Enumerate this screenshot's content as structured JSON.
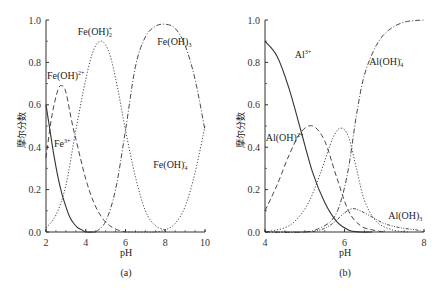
{
  "chart_data": [
    {
      "type": "line",
      "panel": "(a)",
      "xlabel": "pH",
      "ylabel": "摩尔分数",
      "xlim": [
        2,
        10
      ],
      "ylim": [
        0,
        1.0
      ],
      "xticks": [
        "2",
        "4",
        "6",
        "8",
        "10"
      ],
      "yticks": [
        "0.0",
        "0.2",
        "0.4",
        "0.6",
        "0.8",
        "1.0"
      ],
      "series": [
        {
          "name": "Fe3+",
          "label": "Fe",
          "sup": "3+",
          "sub": "",
          "style": "solid",
          "x": [
            2.0,
            2.2,
            2.4,
            2.6,
            2.8,
            3.0,
            3.2,
            3.4,
            3.6,
            3.8,
            4.0,
            4.5
          ],
          "y": [
            0.6,
            0.48,
            0.36,
            0.26,
            0.18,
            0.12,
            0.07,
            0.04,
            0.02,
            0.01,
            0.0,
            0.0
          ]
        },
        {
          "name": "Fe(OH)2+",
          "label": "Fe(OH)",
          "sup": "2+",
          "sub": "",
          "style": "dashed",
          "x": [
            2.0,
            2.3,
            2.6,
            2.8,
            3.0,
            3.3,
            3.6,
            4.0,
            4.4,
            4.8,
            5.2,
            5.6,
            6.0
          ],
          "y": [
            0.35,
            0.55,
            0.67,
            0.69,
            0.66,
            0.52,
            0.4,
            0.25,
            0.14,
            0.07,
            0.03,
            0.01,
            0.0
          ]
        },
        {
          "name": "Fe(OH)2+",
          "label": "Fe(OH)",
          "sup": "+",
          "sub": "2",
          "style": "dotted",
          "x": [
            2.0,
            2.5,
            3.0,
            3.5,
            4.0,
            4.4,
            4.8,
            5.2,
            5.6,
            6.0,
            6.5,
            7.0,
            7.5,
            8.0
          ],
          "y": [
            0.02,
            0.08,
            0.22,
            0.48,
            0.72,
            0.86,
            0.9,
            0.84,
            0.68,
            0.48,
            0.26,
            0.1,
            0.03,
            0.01
          ]
        },
        {
          "name": "Fe(OH)3",
          "label": "Fe(OH)",
          "sup": "",
          "sub": "3",
          "style": "dashdot",
          "x": [
            4.5,
            5.0,
            5.5,
            6.0,
            6.5,
            7.0,
            7.5,
            8.0,
            8.5,
            9.0,
            9.5,
            10.0
          ],
          "y": [
            0.0,
            0.05,
            0.2,
            0.48,
            0.78,
            0.92,
            0.97,
            0.98,
            0.96,
            0.88,
            0.72,
            0.48
          ]
        },
        {
          "name": "Fe(OH)4-",
          "label": "Fe(OH)",
          "sup": "-",
          "sub": "4",
          "style": "dotted",
          "x": [
            6.0,
            7.0,
            7.5,
            8.0,
            8.5,
            9.0,
            9.5,
            10.0
          ],
          "y": [
            0.0,
            0.0,
            0.0,
            0.01,
            0.04,
            0.12,
            0.28,
            0.5
          ]
        }
      ],
      "annotations": [
        {
          "text": "Fe(OH)",
          "sup": "+",
          "sub": "2",
          "x": 3.6,
          "y": 0.93
        },
        {
          "text": "Fe(OH)",
          "sup": "",
          "sub": "3",
          "x": 7.6,
          "y": 0.88
        },
        {
          "text": "Fe(OH)",
          "sup": "2+",
          "sub": "",
          "x": 2.05,
          "y": 0.72
        },
        {
          "text": "Fe",
          "sup": "3+",
          "sub": "",
          "x": 2.4,
          "y": 0.4
        },
        {
          "text": "Fe(OH)",
          "sup": "-",
          "sub": "4",
          "x": 7.4,
          "y": 0.3
        }
      ]
    },
    {
      "type": "line",
      "panel": "(b)",
      "xlabel": "pH",
      "ylabel": "摩尔分数",
      "xlim": [
        4,
        8
      ],
      "ylim": [
        0,
        1.0
      ],
      "xticks": [
        "4",
        "6",
        "8"
      ],
      "yticks": [
        "0.0",
        "0.2",
        "0.4",
        "0.6",
        "0.8",
        "1.0"
      ],
      "series": [
        {
          "name": "Al3+",
          "style": "solid",
          "x": [
            4.0,
            4.3,
            4.6,
            4.9,
            5.2,
            5.5,
            5.8,
            6.1,
            6.4,
            6.7
          ],
          "y": [
            0.9,
            0.83,
            0.68,
            0.48,
            0.28,
            0.14,
            0.05,
            0.01,
            0.0,
            0.0
          ]
        },
        {
          "name": "Al(OH)2+",
          "style": "dashed",
          "x": [
            4.0,
            4.3,
            4.6,
            4.9,
            5.2,
            5.5,
            5.8,
            6.1,
            6.4,
            6.7,
            7.0
          ],
          "y": [
            0.1,
            0.22,
            0.36,
            0.47,
            0.5,
            0.43,
            0.26,
            0.1,
            0.03,
            0.01,
            0.0
          ]
        },
        {
          "name": "Al(OH)2+ (dotted)",
          "style": "dotted",
          "x": [
            4.0,
            4.5,
            4.8,
            5.1,
            5.4,
            5.7,
            5.9,
            6.1,
            6.3,
            6.5,
            6.8,
            7.2,
            7.6
          ],
          "y": [
            0.0,
            0.02,
            0.06,
            0.14,
            0.28,
            0.44,
            0.49,
            0.45,
            0.3,
            0.15,
            0.05,
            0.01,
            0.0
          ]
        },
        {
          "name": "Al(OH)3",
          "style": "dotdot",
          "x": [
            4.0,
            5.0,
            5.4,
            5.7,
            6.0,
            6.2,
            6.4,
            6.7,
            7.0,
            7.4,
            7.8,
            8.0
          ],
          "y": [
            0.0,
            0.0,
            0.01,
            0.04,
            0.09,
            0.11,
            0.1,
            0.07,
            0.04,
            0.02,
            0.01,
            0.0
          ]
        },
        {
          "name": "Al(OH)4-",
          "style": "dashdot",
          "x": [
            4.0,
            5.0,
            5.4,
            5.7,
            5.9,
            6.1,
            6.3,
            6.5,
            6.8,
            7.1,
            7.5,
            8.0
          ],
          "y": [
            0.0,
            0.0,
            0.02,
            0.06,
            0.14,
            0.3,
            0.55,
            0.74,
            0.88,
            0.95,
            0.99,
            1.0
          ]
        }
      ],
      "annotations": [
        {
          "text": "Al",
          "sup": "3+",
          "sub": "",
          "x": 4.75,
          "y": 0.82
        },
        {
          "text": "Al(OH)",
          "sup": "2+",
          "sub": "",
          "x": 4.02,
          "y": 0.43
        },
        {
          "text": "Al(OH)",
          "sup": "-",
          "sub": "4",
          "x": 6.62,
          "y": 0.79
        },
        {
          "text": "Al(OH)",
          "sup": "",
          "sub": "3",
          "x": 7.1,
          "y": 0.06
        }
      ]
    }
  ],
  "panels": {
    "a": {
      "caption": "(a)",
      "xlabel": "pH",
      "ylabel": "摩尔分数"
    },
    "b": {
      "caption": "(b)",
      "xlabel": "pH",
      "ylabel": "摩尔分数"
    }
  }
}
